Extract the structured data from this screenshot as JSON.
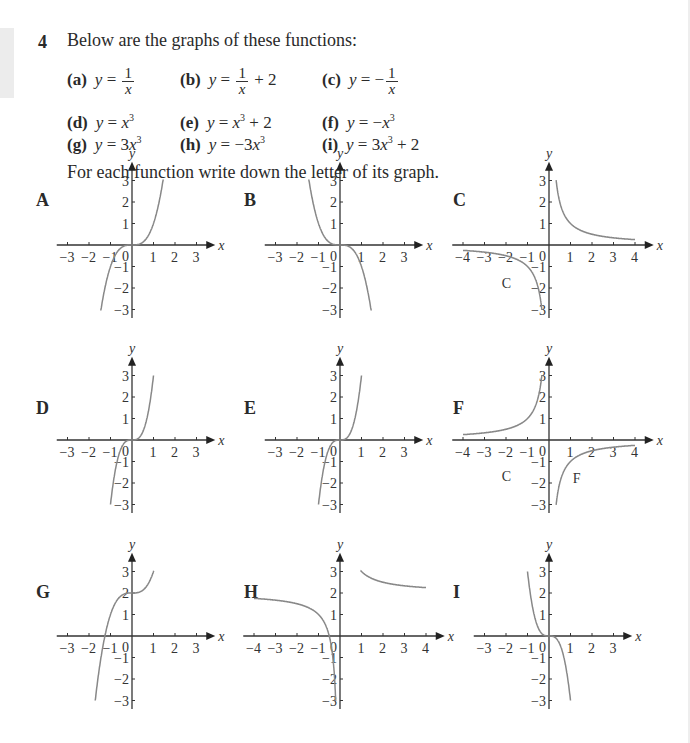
{
  "question": {
    "number": "4",
    "intro": "Below are the graphs of these functions:",
    "instruction": "For each function write down the letter of its graph.",
    "functions": [
      {
        "letter": "(a)",
        "expr": "y = 1/x"
      },
      {
        "letter": "(b)",
        "expr": "y = 1/x + 2"
      },
      {
        "letter": "(c)",
        "expr": "y = −1/x"
      },
      {
        "letter": "(d)",
        "expr": "y = x³"
      },
      {
        "letter": "(e)",
        "expr": "y = x³ + 2"
      },
      {
        "letter": "(f)",
        "expr": "y = −x³"
      },
      {
        "letter": "(g)",
        "expr": "y = 3x³"
      },
      {
        "letter": "(h)",
        "expr": "y = −3x³"
      },
      {
        "letter": "(i)",
        "expr": "y = 3x³ + 2"
      }
    ]
  },
  "graphs": [
    {
      "label": "A",
      "xmin": -3,
      "xmax": 3,
      "curve": "x^3"
    },
    {
      "label": "B",
      "xmin": -3,
      "xmax": 3,
      "curve": "-x^3"
    },
    {
      "label": "C",
      "xmin": -4,
      "xmax": 4,
      "curve": "1/x",
      "annotation": "C"
    },
    {
      "label": "D",
      "xmin": -3,
      "xmax": 3,
      "curve": "3x^3"
    },
    {
      "label": "E",
      "xmin": -3,
      "xmax": 3,
      "curve": "3x^3"
    },
    {
      "label": "F",
      "xmin": -4,
      "xmax": 4,
      "curve": "-1/x",
      "annotation": "C F"
    },
    {
      "label": "G",
      "xmin": -3,
      "xmax": 3,
      "curve": "x^3+2"
    },
    {
      "label": "H",
      "xmin": -4,
      "xmax": 4,
      "curve": "1/x+2"
    },
    {
      "label": "I",
      "xmin": -3,
      "xmax": 3,
      "curve": "-3x^3"
    }
  ],
  "axis": {
    "x_label": "x",
    "y_label": "y",
    "y_ticks": [
      3,
      2,
      1,
      -1,
      -2,
      -3
    ],
    "origin_label": "0"
  },
  "chart_data": {
    "type": "line",
    "panels": [
      "A",
      "B",
      "C",
      "D",
      "E",
      "F",
      "G",
      "H",
      "I"
    ],
    "ylim": [
      -3,
      3
    ]
  }
}
